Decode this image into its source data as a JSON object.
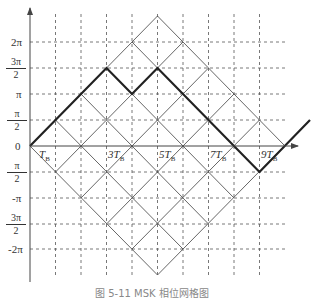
{
  "diagram": {
    "type": "phase-trellis",
    "y_axis": {
      "labels": [
        {
          "text": "2π",
          "value": "2pi"
        },
        {
          "num": "3π",
          "den": "2",
          "value": "3pi/2"
        },
        {
          "text": "π",
          "value": "pi"
        },
        {
          "num": "π",
          "den": "2",
          "value": "pi/2"
        },
        {
          "text": "0",
          "value": "0"
        },
        {
          "num": "π",
          "den": "2",
          "sign": "-",
          "value": "-pi/2"
        },
        {
          "text": "-π",
          "value": "-pi"
        },
        {
          "num": "3π",
          "den": "2",
          "sign": "-",
          "value": "-3pi/2"
        },
        {
          "text": "-2π",
          "value": "-2pi"
        }
      ]
    },
    "x_axis": {
      "labels": [
        {
          "coef": "",
          "sym": "T",
          "sub": "B"
        },
        {
          "coef": "3",
          "sym": "T",
          "sub": "B"
        },
        {
          "coef": "5",
          "sym": "T",
          "sub": "B"
        },
        {
          "coef": "7",
          "sym": "T",
          "sub": "B"
        },
        {
          "coef": "9",
          "sym": "T",
          "sub": "B"
        }
      ]
    },
    "highlighted_path": [
      "0",
      "pi/2",
      "pi",
      "3pi/2",
      "pi",
      "3pi/2",
      "pi",
      "pi/2",
      "0",
      "-pi/2",
      "0",
      "pi/2"
    ],
    "caption": "图 5-11  MSK 相位网格图"
  },
  "colors": {
    "grid": "#555555",
    "trellis": "#555555",
    "path": "#222222",
    "axis": "#444444"
  }
}
